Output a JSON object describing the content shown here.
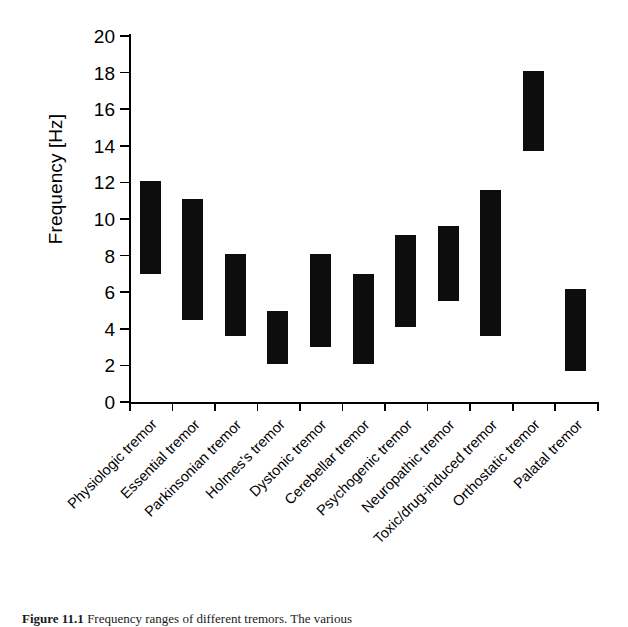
{
  "figure": {
    "caption_label": "Figure 11.1",
    "caption_text": "Frequency ranges of different tremors. The various"
  },
  "axes": {
    "ylabel": "Frequency [Hz]",
    "xlabel": "",
    "yticks": [
      0,
      2,
      4,
      6,
      8,
      10,
      12,
      14,
      16,
      18,
      20
    ],
    "ytick_labels": [
      "0",
      "2",
      "4",
      "6",
      "8",
      "10",
      "12",
      "14",
      "16",
      "18",
      "20"
    ],
    "ylim": [
      0,
      20
    ],
    "grid": false,
    "legend": "none"
  },
  "chart_data": {
    "type": "bar",
    "subtype": "floating-range-bar",
    "title": "",
    "xlabel": "",
    "ylabel": "Frequency [Hz]",
    "ylim": [
      0,
      20
    ],
    "yticks": [
      0,
      2,
      4,
      6,
      8,
      10,
      12,
      14,
      16,
      18,
      20
    ],
    "grid": false,
    "legend": "none",
    "units": "Hz",
    "categories": [
      "Physiologic tremor",
      "Essential tremor",
      "Parkinsonian tremor",
      "Holmes's tremor",
      "Dystonic tremor",
      "Cerebellar tremor",
      "Psychogenic tremor",
      "Neuropathic tremor",
      "Toxic/drug-induced tremor",
      "Orthostatic tremor",
      "Palatal tremor"
    ],
    "series": [
      {
        "name": "low",
        "values": [
          7.0,
          4.5,
          3.6,
          2.1,
          3.0,
          2.1,
          4.1,
          5.5,
          3.6,
          13.7,
          1.7
        ]
      },
      {
        "name": "high",
        "values": [
          12.1,
          11.1,
          8.1,
          5.0,
          8.1,
          7.0,
          9.1,
          9.6,
          11.6,
          18.1,
          6.2
        ]
      }
    ],
    "ranges": [
      {
        "category": "Physiologic tremor",
        "low": 7.0,
        "high": 12.1
      },
      {
        "category": "Essential tremor",
        "low": 4.5,
        "high": 11.1
      },
      {
        "category": "Parkinsonian tremor",
        "low": 3.6,
        "high": 8.1
      },
      {
        "category": "Holmes's tremor",
        "low": 2.1,
        "high": 5.0
      },
      {
        "category": "Dystonic tremor",
        "low": 3.0,
        "high": 8.1
      },
      {
        "category": "Cerebellar tremor",
        "low": 2.1,
        "high": 7.0
      },
      {
        "category": "Psychogenic tremor",
        "low": 4.1,
        "high": 9.1
      },
      {
        "category": "Neuropathic tremor",
        "low": 5.5,
        "high": 9.6
      },
      {
        "category": "Toxic/drug-induced tremor",
        "low": 3.6,
        "high": 11.6
      },
      {
        "category": "Orthostatic tremor",
        "low": 13.7,
        "high": 18.1
      },
      {
        "category": "Palatal tremor",
        "low": 1.7,
        "high": 6.2
      }
    ],
    "bar_color": "#0d0d0d"
  }
}
